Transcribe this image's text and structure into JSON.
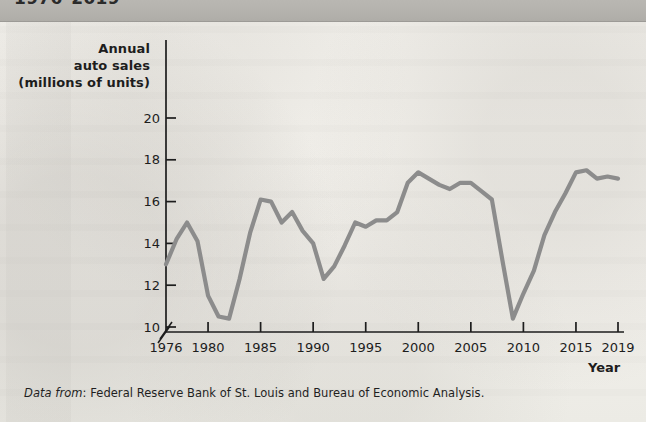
{
  "header": {
    "title": "1976–2019"
  },
  "figure": {
    "y_axis_caption_lines": [
      "Annual",
      "auto sales",
      "(millions of units)"
    ],
    "x_axis_label": "Year",
    "source_prefix": "Data from",
    "source_text": ": Federal Reserve Bank of St. Louis and Bureau of Economic Analysis.",
    "line_color": "#8c8c8c",
    "axis_color": "#1d1d1d",
    "page_color": "#f3f1ec",
    "header_band_color": "#b4b2ad"
  },
  "chart_data": {
    "type": "line",
    "title": "1976–2019",
    "xlabel": "Year",
    "ylabel": "Annual auto sales (millions of units)",
    "xlim": [
      1976,
      2019
    ],
    "ylim": [
      9.6,
      20.8
    ],
    "yticks": [
      10,
      12,
      14,
      16,
      18,
      20
    ],
    "xticks": [
      1976,
      1980,
      1985,
      1990,
      1995,
      2000,
      2005,
      2010,
      2015,
      2019
    ],
    "xticklabels": [
      "1976",
      "1980",
      "1985",
      "1990",
      "1995",
      "2000",
      "2005",
      "2010",
      "2015",
      "2019"
    ],
    "yticklabels": [
      "10",
      "12",
      "14",
      "16",
      "18",
      "20"
    ],
    "y_axis_break": true,
    "grid": false,
    "legend": false,
    "series": [
      {
        "name": "Annual auto sales",
        "color": "#8c8c8c",
        "x": [
          1976,
          1977,
          1978,
          1979,
          1980,
          1981,
          1982,
          1983,
          1984,
          1985,
          1986,
          1987,
          1988,
          1989,
          1990,
          1991,
          1992,
          1993,
          1994,
          1995,
          1996,
          1997,
          1998,
          1999,
          2000,
          2001,
          2002,
          2003,
          2004,
          2005,
          2006,
          2007,
          2008,
          2009,
          2010,
          2011,
          2012,
          2013,
          2014,
          2015,
          2016,
          2017,
          2018,
          2019
        ],
        "values": [
          13.0,
          14.2,
          15.0,
          14.1,
          11.5,
          10.5,
          10.4,
          12.3,
          14.5,
          16.1,
          16.0,
          15.0,
          15.5,
          14.6,
          14.0,
          12.3,
          12.9,
          13.9,
          15.0,
          14.8,
          15.1,
          15.1,
          15.5,
          16.9,
          17.4,
          17.1,
          16.8,
          16.6,
          16.9,
          16.9,
          16.5,
          16.1,
          13.2,
          10.4,
          11.6,
          12.7,
          14.4,
          15.5,
          16.4,
          17.4,
          17.5,
          17.1,
          17.2,
          17.1
        ]
      }
    ]
  }
}
